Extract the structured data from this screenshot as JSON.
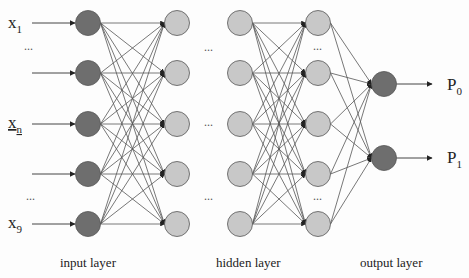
{
  "diagram": {
    "type": "neural-network",
    "colors": {
      "input_node": "#6e6e6e",
      "hidden_node": "#c8c8c8",
      "output_node": "#6e6e6e",
      "edge": "#555555",
      "background": "#fdfdfd"
    },
    "inputs": [
      {
        "label": "x",
        "sub": "1"
      },
      {
        "label": "...",
        "sub": ""
      },
      {
        "label": "x",
        "sub": "n"
      },
      {
        "label": "...",
        "sub": ""
      },
      {
        "label": "x",
        "sub": "9"
      }
    ],
    "outputs": [
      {
        "label": "P",
        "sub": "0"
      },
      {
        "label": "P",
        "sub": "1"
      }
    ],
    "ellipsis": "...",
    "layer_labels": {
      "input": "input layer",
      "hidden": "hidden layer",
      "output": "output layer"
    }
  }
}
